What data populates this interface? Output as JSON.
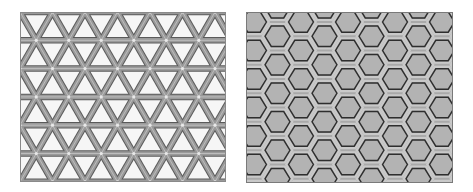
{
  "figure": {
    "panels": [
      {
        "id": "triangle-lattice",
        "pattern": "triangular",
        "width": 206,
        "height": 170,
        "background": "#f6f6f6",
        "row_height": 28.3,
        "column_spacing": 32.5,
        "outer_stroke": "#5a5a5a",
        "band_fill": "#9a9a9a",
        "band_width": 4.5,
        "edge_width": 1
      },
      {
        "id": "hexagon-lattice",
        "pattern": "hexagonal",
        "width": 207,
        "height": 171,
        "background": "#a9a9a9",
        "cell_fill": "#b3b3b3",
        "outline_color": "#2e2e2e",
        "band_color": "#c9c9c9",
        "hex_radius": 13,
        "col_spacing": 23.5,
        "row_spacing": 28.5
      }
    ]
  }
}
